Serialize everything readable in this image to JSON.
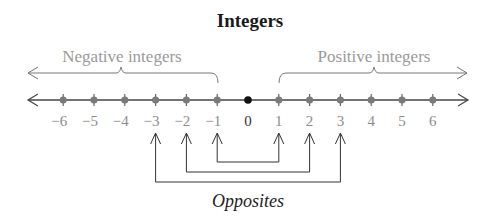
{
  "title": "Integers",
  "negative_label": "Negative integers",
  "positive_label": "Positive integers",
  "opposites_label": "Opposites",
  "colors": {
    "line": "#444444",
    "gray_text": "#9a9a9a",
    "tick_text": "#8c8c8c",
    "dot": "#111111"
  },
  "number_line": {
    "ticks": [
      {
        "value": -6,
        "label": "−6"
      },
      {
        "value": -5,
        "label": "−5"
      },
      {
        "value": -4,
        "label": "−4"
      },
      {
        "value": -3,
        "label": "−3"
      },
      {
        "value": -2,
        "label": "−2"
      },
      {
        "value": -1,
        "label": "−1"
      },
      {
        "value": 0,
        "label": "0"
      },
      {
        "value": 1,
        "label": "1"
      },
      {
        "value": 2,
        "label": "2"
      },
      {
        "value": 3,
        "label": "3"
      },
      {
        "value": 4,
        "label": "4"
      },
      {
        "value": 5,
        "label": "5"
      },
      {
        "value": 6,
        "label": "6"
      }
    ]
  },
  "opposite_pairs": [
    [
      -1,
      1
    ],
    [
      -2,
      2
    ],
    [
      -3,
      3
    ]
  ]
}
